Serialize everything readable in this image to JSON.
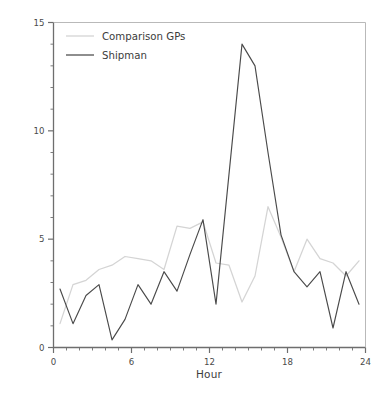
{
  "chart_data": {
    "type": "line",
    "title": "",
    "xlabel": "Hour",
    "ylabel": "Percentage of deaths",
    "xlim": [
      0,
      24
    ],
    "ylim": [
      0,
      15
    ],
    "xticks": [
      0,
      6,
      12,
      18,
      24
    ],
    "xtick_labels": [
      "0",
      "6",
      "12",
      "18",
      "24"
    ],
    "x_minor_tick_step": 1,
    "yticks": [
      0,
      5,
      10,
      15
    ],
    "ytick_labels": [
      "0",
      "5",
      "10",
      "15"
    ],
    "y_minor_tick_step": 1,
    "grid": false,
    "legend_position": "top-left inside",
    "x": [
      0.5,
      1.5,
      2.5,
      3.5,
      4.5,
      5.5,
      6.5,
      7.5,
      8.5,
      9.5,
      10.5,
      11.5,
      12.5,
      13.5,
      14.5,
      15.5,
      16.5,
      17.5,
      18.5,
      19.5,
      20.5,
      21.5,
      22.5,
      23.5
    ],
    "series": [
      {
        "name": "Comparison GPs",
        "color": "#d4d4d4",
        "values": [
          1.1,
          2.9,
          3.1,
          3.6,
          3.8,
          4.2,
          4.1,
          4.0,
          3.6,
          5.6,
          5.5,
          5.8,
          3.9,
          3.8,
          2.1,
          3.3,
          6.5,
          5.1,
          3.5,
          5.0,
          4.1,
          3.9,
          3.3,
          4.0
        ]
      },
      {
        "name": "Shipman",
        "color": "#4a4a4a",
        "values": [
          2.7,
          1.1,
          2.4,
          2.9,
          0.35,
          1.3,
          2.9,
          2.0,
          3.5,
          2.6,
          4.3,
          5.9,
          2.0,
          8.0,
          14.0,
          13.0,
          9.0,
          5.2,
          3.5,
          2.8,
          3.5,
          0.9,
          3.5,
          2.0
        ]
      }
    ]
  },
  "legend": {
    "items": [
      {
        "label": "Comparison GPs"
      },
      {
        "label": "Shipman"
      }
    ]
  }
}
